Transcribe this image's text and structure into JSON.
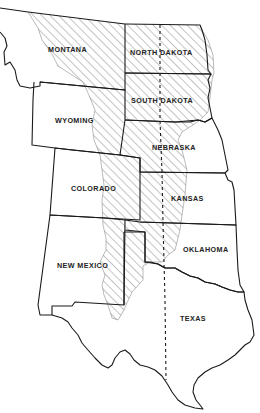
{
  "map": {
    "type": "regional outline map",
    "colors": {
      "background": "#ffffff",
      "border": "#1a1a1a",
      "hatch": "#555555",
      "label": "#222222"
    },
    "states": [
      {
        "id": "montana",
        "label": "MONTANA"
      },
      {
        "id": "north-dakota",
        "label": "NORTH DAKOTA"
      },
      {
        "id": "wyoming",
        "label": "WYOMING"
      },
      {
        "id": "south-dakota",
        "label": "SOUTH DAKOTA"
      },
      {
        "id": "nebraska",
        "label": "NEBRASKA"
      },
      {
        "id": "colorado",
        "label": "COLORADO"
      },
      {
        "id": "kansas",
        "label": "KANSAS"
      },
      {
        "id": "new-mexico",
        "label": "NEW MEXICO"
      },
      {
        "id": "oklahoma",
        "label": "OKLAHOMA"
      },
      {
        "id": "texas",
        "label": "TEXAS"
      }
    ],
    "legend_features": {
      "hatched_region": "hatched (diagonal lines) area across eastern MT/WY/CO/NM and western Dakotas/NE/KS/OK/TX panhandle",
      "dashed_line": "north–south dashed line through Dakotas, Nebraska, Kansas and Texas"
    }
  }
}
